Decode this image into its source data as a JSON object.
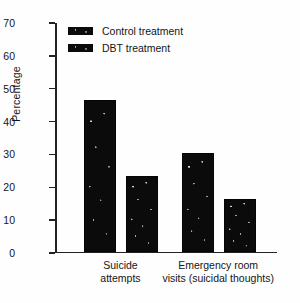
{
  "chart_data": {
    "type": "bar",
    "title": "",
    "xlabel": "",
    "ylabel": "Percentage",
    "ylim": [
      0,
      70
    ],
    "yticks": [
      0,
      10,
      20,
      30,
      40,
      50,
      60,
      70
    ],
    "grid": false,
    "legend_position": "top-left",
    "categories": [
      "Suicide attempts",
      "Emergency room visits (suicidal thoughts)"
    ],
    "category_lines": [
      [
        "Suicide",
        "attempts"
      ],
      [
        "Emergency room",
        "visits (suicidal thoughts)"
      ]
    ],
    "series": [
      {
        "name": "Control treatment",
        "values": [
          46,
          30
        ],
        "color": "#0b0b0b"
      },
      {
        "name": "DBT treatment",
        "values": [
          23,
          16
        ],
        "color": "#0b0b0b"
      }
    ]
  },
  "legend": {
    "items": [
      {
        "label": "Control treatment"
      },
      {
        "label": "DBT treatment"
      }
    ]
  },
  "axis": {
    "y_title": "Percentage",
    "y_ticks": [
      "70",
      "60",
      "50",
      "40",
      "30",
      "20",
      "10",
      "0"
    ]
  }
}
